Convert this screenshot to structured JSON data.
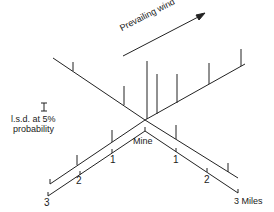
{
  "diagram": {
    "wind_label": "Prevailing wind",
    "legend_symbol": "I",
    "legend_line1": "l.s.d. at 5%",
    "legend_line2": "probability",
    "center_label": "Mine",
    "distance_ticks": {
      "left": [
        "1",
        "2",
        "3"
      ],
      "right": [
        "1",
        "2",
        "3 Miles"
      ]
    }
  }
}
